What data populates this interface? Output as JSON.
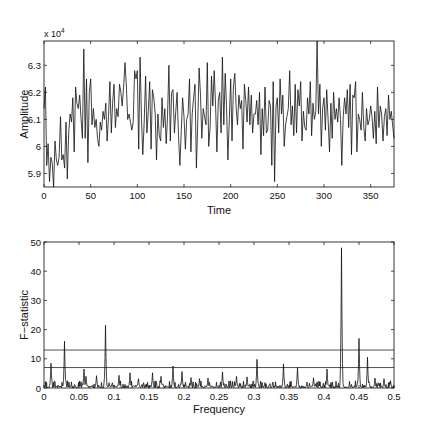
{
  "chart_data": [
    {
      "type": "line",
      "title": "",
      "xlabel": "Time",
      "ylabel": "Amplitude",
      "y_multiplier_label": "x 10^4",
      "y_multiplier_base": "x 10",
      "y_multiplier_exp": "4",
      "xlim": [
        0,
        375
      ],
      "ylim": [
        5.85,
        6.39
      ],
      "xticks": [
        0,
        50,
        100,
        150,
        200,
        250,
        300,
        350
      ],
      "xtick_labels": [
        "0",
        "50",
        "100",
        "150",
        "200",
        "250",
        "300",
        "350"
      ],
      "yticks": [
        5.9,
        6.0,
        6.1,
        6.2,
        6.3
      ],
      "ytick_labels": [
        "5.9",
        "6",
        "6.1",
        "6.2",
        "6.3"
      ],
      "grid": false,
      "series": [
        {
          "name": "Amplitude",
          "x_step": 2,
          "values": [
            6.14,
            6.22,
            5.93,
            6.01,
            5.87,
            5.96,
            5.94,
            5.85,
            6.02,
            5.95,
            5.93,
            5.96,
            6.11,
            5.95,
            5.97,
            5.92,
            6.09,
            5.88,
            6.05,
            6.12,
            6.09,
            6.18,
            5.98,
            6.22,
            6.16,
            6.14,
            6.19,
            6.1,
            6.03,
            6.36,
            6.03,
            6.25,
            5.94,
            6.2,
            6.25,
            6.08,
            6.14,
            6.07,
            6.1,
            6.03,
            6.0,
            6.09,
            6.06,
            6.13,
            6.1,
            6.16,
            6.02,
            6.11,
            6.24,
            6.05,
            6.16,
            6.23,
            6.07,
            6.14,
            6.11,
            6.23,
            6.2,
            6.15,
            6.22,
            6.31,
            6.22,
            6.1,
            6.12,
            6.09,
            6.06,
            6.09,
            6.28,
            6.25,
            6.28,
            5.99,
            6.33,
            6.1,
            5.97,
            6.09,
            6.26,
            6.05,
            6.13,
            6.24,
            5.99,
            6.21,
            6.18,
            6.12,
            5.95,
            6.12,
            6.04,
            6.02,
            6.18,
            6.07,
            6.14,
            6.01,
            6.11,
            6.3,
            6.02,
            6.2,
            6.21,
            6.05,
            6.13,
            6.2,
            6.04,
            5.93,
            6.06,
            6.18,
            6.11,
            5.99,
            6.1,
            6.12,
            6.25,
            5.98,
            6.12,
            6.18,
            6.23,
            5.92,
            6.08,
            6.29,
            6.19,
            6.03,
            6.14,
            6.11,
            6.08,
            6.31,
            6.0,
            6.07,
            6.26,
            6.15,
            6.28,
            6.15,
            5.98,
            6.17,
            6.2,
            6.05,
            6.33,
            6.08,
            6.27,
            6.15,
            5.95,
            6.1,
            6.25,
            6.02,
            6.22,
            6.27,
            6.14,
            6.08,
            6.19,
            6.14,
            6.17,
            5.99,
            6.23,
            6.17,
            6.09,
            6.22,
            6.08,
            6.19,
            6.05,
            6.12,
            6.12,
            6.17,
            6.08,
            6.2,
            5.97,
            6.14,
            6.04,
            6.22,
            6.05,
            6.06,
            6.17,
            6.15,
            5.93,
            6.24,
            5.87,
            6.15,
            6.18,
            6.05,
            6.25,
            6.12,
            6.19,
            6.0,
            6.08,
            6.11,
            6.14,
            6.28,
            6.08,
            6.15,
            6.04,
            6.23,
            6.05,
            6.21,
            6.15,
            6.24,
            6.02,
            6.13,
            6.07,
            6.06,
            6.18,
            6.12,
            6.24,
            6.04,
            6.16,
            6.1,
            6.13,
            6.39,
            6.12,
            6.23,
            6.0,
            6.14,
            6.18,
            6.06,
            6.21,
            6.1,
            5.98,
            6.16,
            6.03,
            6.2,
            6.1,
            6.14,
            6.09,
            6.18,
            6.1,
            5.93,
            6.11,
            6.18,
            6.12,
            6.21,
            6.07,
            6.23,
            5.97,
            6.19,
            6.18,
            6.24,
            5.98,
            6.12,
            6.1,
            6.06,
            6.2,
            6.07,
            6.02,
            6.14,
            6.08,
            6.1,
            6.15,
            6.11,
            6.03,
            6.13,
            6.01,
            6.22,
            6.07,
            6.15,
            6.12,
            6.02,
            6.11,
            6.14,
            6.04,
            6.19,
            6.1,
            6.13,
            6.08,
            6.03
          ]
        }
      ]
    },
    {
      "type": "line",
      "title": "",
      "xlabel": "Frequency",
      "ylabel": "F−statistic",
      "xlim": [
        0,
        0.5
      ],
      "ylim": [
        0,
        50
      ],
      "xticks": [
        0,
        0.05,
        0.1,
        0.15,
        0.2,
        0.25,
        0.3,
        0.35,
        0.4,
        0.45,
        0.5
      ],
      "xtick_labels": [
        "0",
        "0.05",
        "0.1",
        "0.15",
        "0.2",
        "0.25",
        "0.3",
        "0.35",
        "0.4",
        "0.45",
        "0.5"
      ],
      "yticks": [
        0,
        10,
        20,
        30,
        40,
        50
      ],
      "ytick_labels": [
        "0",
        "10",
        "20",
        "30",
        "40",
        "50"
      ],
      "grid": false,
      "reference_lines": [
        {
          "name": "threshold-high",
          "y": 13
        },
        {
          "name": "threshold-low",
          "y": 7
        }
      ],
      "peaks": [
        {
          "x": 0.01,
          "y": 8.5
        },
        {
          "x": 0.029,
          "y": 16
        },
        {
          "x": 0.057,
          "y": 6.5
        },
        {
          "x": 0.06,
          "y": 4
        },
        {
          "x": 0.075,
          "y": 4.2
        },
        {
          "x": 0.088,
          "y": 21.5
        },
        {
          "x": 0.107,
          "y": 4.3
        },
        {
          "x": 0.123,
          "y": 5.2
        },
        {
          "x": 0.135,
          "y": 3.2
        },
        {
          "x": 0.155,
          "y": 5.2
        },
        {
          "x": 0.167,
          "y": 4
        },
        {
          "x": 0.184,
          "y": 7.5
        },
        {
          "x": 0.197,
          "y": 5.6
        },
        {
          "x": 0.21,
          "y": 3.6
        },
        {
          "x": 0.222,
          "y": 3.2
        },
        {
          "x": 0.234,
          "y": 3.4
        },
        {
          "x": 0.255,
          "y": 5.5
        },
        {
          "x": 0.275,
          "y": 4
        },
        {
          "x": 0.29,
          "y": 3.8
        },
        {
          "x": 0.304,
          "y": 9.8
        },
        {
          "x": 0.342,
          "y": 8.2
        },
        {
          "x": 0.362,
          "y": 7
        },
        {
          "x": 0.385,
          "y": 3.5
        },
        {
          "x": 0.404,
          "y": 6.5
        },
        {
          "x": 0.425,
          "y": 48
        },
        {
          "x": 0.45,
          "y": 17
        },
        {
          "x": 0.462,
          "y": 10.5
        },
        {
          "x": 0.473,
          "y": 3.4
        },
        {
          "x": 0.486,
          "y": 3.2
        },
        {
          "x": 0.495,
          "y": 2.5
        }
      ],
      "baseline_noise_max": 2.5
    }
  ]
}
